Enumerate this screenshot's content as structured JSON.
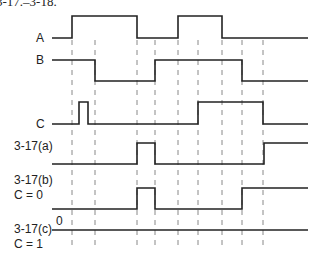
{
  "caption": "3-17.–3-18.",
  "labels": {
    "A": "A",
    "B": "B",
    "C": "C",
    "a": "3-17(a)",
    "b1": "3-17(b)",
    "b2": "C = 0",
    "c1": "3-17(c)",
    "c2": "C = 1",
    "zero": "0"
  },
  "dashed_x": [
    72,
    95,
    137,
    155,
    178,
    198,
    222,
    242,
    263
  ],
  "signals": {
    "A": "M52,38 H72 V16 H137 V38 H178 V16 H222 V38 H308",
    "B": "M52,60 H95 V81 H155 V60 H242 V81 H308",
    "C": "M52,124 H79 V102 H88 V124 H198 V102 H263 V124 H308",
    "a": "M52,164 H137 V143 H155 V164 H264 V143 H308",
    "b": "M52,209 H137 V188 H155 V209 H242 V188 H308",
    "c": "M52,230 H308"
  },
  "colors": {
    "line": "#222222",
    "dash": "#888888"
  }
}
